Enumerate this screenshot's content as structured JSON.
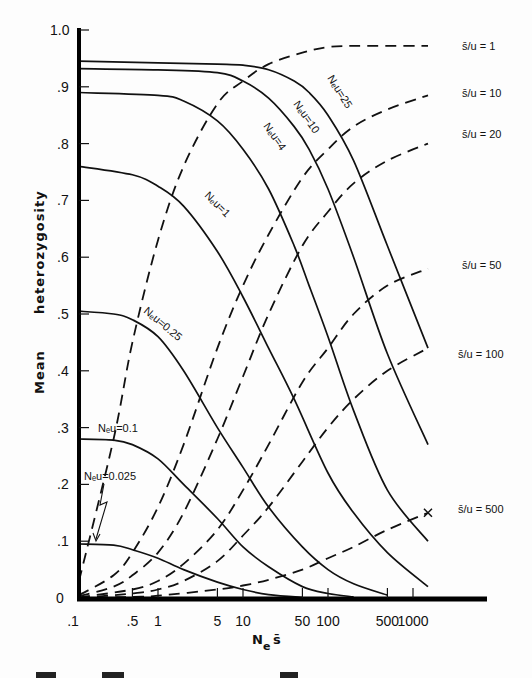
{
  "chart_data": {
    "type": "line",
    "title": "",
    "xlabel": "N_e s̄",
    "ylabel": "Mean heterozygosity",
    "xscale": "log",
    "xlim": [
      0.1,
      3000
    ],
    "ylim": [
      0,
      1.0
    ],
    "x_ticks": [
      0.1,
      0.5,
      1,
      5,
      10,
      50,
      100,
      500,
      1000
    ],
    "x_tick_labels": [
      ".1",
      ".5",
      "1",
      "5",
      "10",
      "50",
      "100",
      "500",
      "1000"
    ],
    "y_ticks": [
      0,
      0.1,
      0.2,
      0.3,
      0.4,
      0.5,
      0.6,
      0.7,
      0.8,
      0.9,
      1.0
    ],
    "y_tick_labels": [
      "0",
      ".1",
      ".2",
      ".3",
      ".4",
      ".5",
      ".6",
      ".7",
      ".8",
      ".9",
      "1.0"
    ],
    "grid": false,
    "legend_position": "inline labels",
    "series": [
      {
        "name": "Neu=25",
        "label": "Neu=25",
        "style": "solid",
        "x": [
          0.1,
          1,
          5,
          10,
          20,
          40,
          60,
          100,
          200,
          500,
          1500
        ],
        "values": [
          0.945,
          0.942,
          0.94,
          0.938,
          0.93,
          0.91,
          0.89,
          0.85,
          0.77,
          0.62,
          0.44
        ]
      },
      {
        "name": "Neu=10",
        "label": "Neu=10",
        "style": "solid",
        "x": [
          0.1,
          1,
          5,
          10,
          20,
          40,
          60,
          100,
          200,
          500,
          1500
        ],
        "values": [
          0.932,
          0.93,
          0.925,
          0.91,
          0.88,
          0.83,
          0.79,
          0.72,
          0.6,
          0.43,
          0.27
        ]
      },
      {
        "name": "Neu=4",
        "label": "Neu=4",
        "style": "solid",
        "x": [
          0.1,
          1,
          2,
          5,
          10,
          20,
          40,
          60,
          100,
          200,
          500,
          1500
        ],
        "values": [
          0.89,
          0.885,
          0.875,
          0.84,
          0.79,
          0.72,
          0.62,
          0.55,
          0.46,
          0.33,
          0.19,
          0.1
        ]
      },
      {
        "name": "Neu=1",
        "label": "Neu=1",
        "style": "solid",
        "x": [
          0.1,
          0.5,
          1,
          2,
          5,
          10,
          20,
          40,
          100,
          200,
          500,
          1500
        ],
        "values": [
          0.76,
          0.745,
          0.725,
          0.69,
          0.61,
          0.53,
          0.44,
          0.35,
          0.22,
          0.15,
          0.08,
          0.02
        ]
      },
      {
        "name": "Neu=0.25",
        "label": "Neu=0.25",
        "style": "solid",
        "x": [
          0.1,
          0.3,
          0.5,
          1,
          2,
          5,
          10,
          20,
          50,
          100,
          200,
          500
        ],
        "values": [
          0.505,
          0.5,
          0.49,
          0.46,
          0.4,
          0.3,
          0.23,
          0.16,
          0.09,
          0.05,
          0.025,
          0.005
        ]
      },
      {
        "name": "Neu=0.1",
        "label": "Neu=0.1",
        "style": "solid",
        "x": [
          0.1,
          0.3,
          0.5,
          1,
          2,
          5,
          10,
          20,
          50,
          100,
          200
        ],
        "values": [
          0.28,
          0.278,
          0.27,
          0.245,
          0.2,
          0.14,
          0.09,
          0.055,
          0.02,
          0.008,
          0.002
        ]
      },
      {
        "name": "Neu=0.025",
        "label": "Neu=0.025",
        "style": "solid",
        "x": [
          0.1,
          0.3,
          0.5,
          1,
          2,
          5,
          10,
          20,
          50
        ],
        "values": [
          0.095,
          0.093,
          0.085,
          0.07,
          0.05,
          0.028,
          0.015,
          0.006,
          0.001
        ]
      },
      {
        "name": "s/u=1",
        "label": "s̄/u = 1",
        "style": "dashed",
        "x": [
          0.1,
          0.3,
          0.5,
          1,
          2,
          5,
          10,
          20,
          50,
          100,
          200,
          500,
          1500
        ],
        "values": [
          0.03,
          0.28,
          0.45,
          0.63,
          0.76,
          0.87,
          0.91,
          0.94,
          0.96,
          0.97,
          0.972,
          0.972,
          0.972
        ]
      },
      {
        "name": "s/u=10",
        "label": "s̄/u = 10",
        "style": "dashed",
        "x": [
          0.1,
          0.3,
          0.5,
          1,
          2,
          5,
          10,
          20,
          50,
          100,
          200,
          500,
          1500
        ],
        "values": [
          0.005,
          0.04,
          0.08,
          0.16,
          0.27,
          0.44,
          0.55,
          0.64,
          0.74,
          0.79,
          0.83,
          0.86,
          0.885
        ]
      },
      {
        "name": "s/u=20",
        "label": "s̄/u = 20",
        "style": "dashed",
        "x": [
          0.1,
          0.3,
          0.5,
          1,
          2,
          5,
          10,
          20,
          50,
          100,
          200,
          500,
          1500
        ],
        "values": [
          0.003,
          0.02,
          0.04,
          0.08,
          0.15,
          0.28,
          0.39,
          0.5,
          0.62,
          0.68,
          0.73,
          0.77,
          0.8
        ]
      },
      {
        "name": "s/u=50",
        "label": "s̄/u = 50",
        "style": "dashed",
        "x": [
          0.1,
          0.5,
          1,
          2,
          5,
          10,
          20,
          50,
          100,
          200,
          500,
          1500
        ],
        "values": [
          0.001,
          0.015,
          0.03,
          0.06,
          0.12,
          0.19,
          0.27,
          0.38,
          0.44,
          0.5,
          0.55,
          0.58
        ]
      },
      {
        "name": "s/u=100",
        "label": "s̄/u = 100",
        "style": "dashed",
        "x": [
          0.1,
          0.5,
          1,
          2,
          5,
          10,
          20,
          50,
          100,
          200,
          500,
          1500
        ],
        "values": [
          0.0,
          0.008,
          0.015,
          0.03,
          0.065,
          0.11,
          0.16,
          0.24,
          0.3,
          0.35,
          0.4,
          0.44
        ]
      },
      {
        "name": "s/u=500",
        "label": "s̄/u = 500",
        "style": "dashed",
        "x": [
          0.1,
          0.5,
          1,
          5,
          10,
          20,
          50,
          100,
          200,
          500,
          1500
        ],
        "values": [
          0.0,
          0.002,
          0.004,
          0.015,
          0.022,
          0.032,
          0.05,
          0.07,
          0.09,
          0.12,
          0.15
        ]
      }
    ],
    "annotations": [
      {
        "text": "Neu=0.025",
        "arrow_to": [
          0.12,
          0.095
        ]
      },
      {
        "text": "×",
        "at": [
          1500,
          0.15
        ]
      }
    ]
  },
  "labels": {
    "ylabel_word1": "Mean",
    "ylabel_word2": "heterozygosity",
    "xlabel_main": "N",
    "xlabel_sub": "e",
    "xlabel_s": "s̄"
  }
}
